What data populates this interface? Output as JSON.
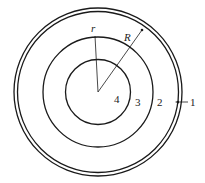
{
  "diagram": {
    "radius_labels": {
      "inner": "r",
      "outer": "R"
    },
    "region_labels": [
      "1",
      "2",
      "3",
      "4"
    ],
    "line_color": "#1a1a1a"
  }
}
